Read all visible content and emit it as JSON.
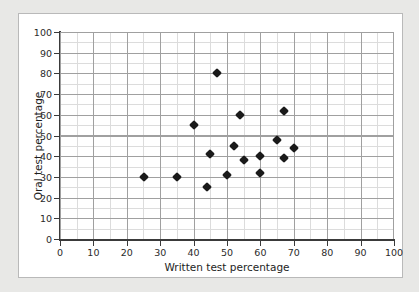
{
  "chart_data": {
    "type": "scatter",
    "title": "",
    "xlabel": "Written test percentage",
    "ylabel": "Oral test percentage",
    "xlim": [
      0,
      100
    ],
    "ylim": [
      0,
      100
    ],
    "xticks": [
      0,
      10,
      20,
      30,
      40,
      50,
      60,
      70,
      80,
      90,
      100
    ],
    "yticks": [
      0,
      10,
      20,
      30,
      40,
      50,
      60,
      70,
      80,
      90,
      100
    ],
    "grid": true,
    "grid_minor_step": 5,
    "grid_major_step": 10,
    "legend": "none",
    "marker": "diamond",
    "marker_color": "#1a1a1a",
    "points": [
      {
        "x": 25,
        "y": 30
      },
      {
        "x": 35,
        "y": 30
      },
      {
        "x": 40,
        "y": 55
      },
      {
        "x": 44,
        "y": 25
      },
      {
        "x": 45,
        "y": 41
      },
      {
        "x": 47,
        "y": 80
      },
      {
        "x": 50,
        "y": 31
      },
      {
        "x": 52,
        "y": 45
      },
      {
        "x": 54,
        "y": 60
      },
      {
        "x": 55,
        "y": 38
      },
      {
        "x": 60,
        "y": 32
      },
      {
        "x": 60,
        "y": 40
      },
      {
        "x": 65,
        "y": 48
      },
      {
        "x": 67,
        "y": 39
      },
      {
        "x": 67,
        "y": 62
      },
      {
        "x": 70,
        "y": 44
      }
    ]
  },
  "figure": {
    "background_color": "#e8e8e6",
    "card_color": "#ffffff",
    "card_border_color": "#b9b9b9",
    "axis_color": "#3a3a3a",
    "grid_major_color": "#a0a0a0",
    "grid_minor_color": "#dcdcdc"
  }
}
